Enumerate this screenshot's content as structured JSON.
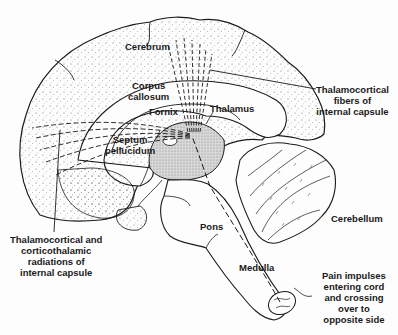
{
  "figure": {
    "type": "anatomical sagittal section of brain showing pain pathway",
    "colors": {
      "ink": "#1a1a1a",
      "stipple": "#6b6b6b",
      "thalamus_fill": "#cfcfcf",
      "background": "#fdfdfd"
    }
  },
  "labels": {
    "cerebrum": "Cerebrum",
    "corpus_callosum": "Corpus\ncallosum",
    "fornix": "Fornix",
    "thalamus": "Thalamus",
    "septum_pellucidum": "Septum\npellucidum",
    "thalamocortical_fibers": "Thalamocortical\nfibers of\ninternal capsule",
    "thalamocortical_radiations": "Thalamocortical and\ncorticothalamic\nradiations of\ninternal capsule",
    "pons": "Pons",
    "medulla": "Medulla",
    "cerebellum": "Cerebellum",
    "pain_impulses": "Pain impulses\nentering cord\nand crossing\nover to\nopposite side"
  }
}
